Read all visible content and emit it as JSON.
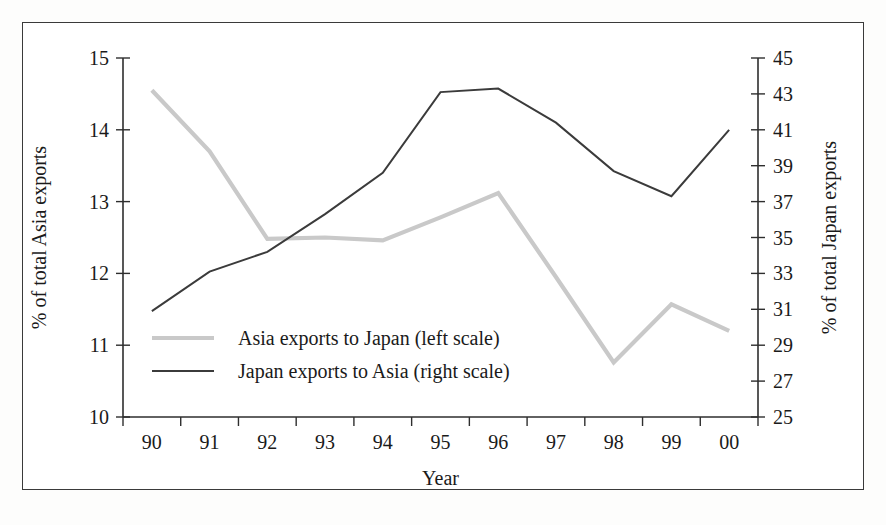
{
  "chart_data": {
    "type": "line",
    "title": "",
    "xlabel": "Year",
    "categories": [
      "90",
      "91",
      "92",
      "93",
      "94",
      "95",
      "96",
      "97",
      "98",
      "99",
      "00"
    ],
    "grid": false,
    "legend_position": "inside-left-lower",
    "axes": {
      "left": {
        "label": "% of total Asia exports",
        "min": 10,
        "max": 15,
        "tick_step": 1,
        "ticks": [
          "10",
          "11",
          "12",
          "13",
          "14",
          "15"
        ]
      },
      "right": {
        "label": "% of total Japan exports",
        "min": 25,
        "max": 45,
        "tick_step": 2,
        "ticks": [
          "25",
          "27",
          "29",
          "31",
          "33",
          "35",
          "37",
          "39",
          "41",
          "43",
          "45"
        ]
      },
      "x": {
        "label": "Year"
      }
    },
    "series": [
      {
        "name": "Asia exports to Japan (left scale)",
        "axis": "left",
        "color": "#c9c9c9",
        "style": "solid-thick-light",
        "values": [
          14.55,
          13.7,
          12.48,
          12.5,
          12.46,
          12.78,
          13.12,
          11.95,
          10.76,
          11.57,
          11.2
        ]
      },
      {
        "name": "Japan exports to Asia (right scale)",
        "axis": "right",
        "color": "#3b3b3b",
        "style": "solid-thin-dark",
        "values": [
          30.9,
          33.1,
          34.2,
          36.3,
          38.6,
          43.1,
          43.3,
          41.4,
          38.7,
          37.3,
          41.0
        ]
      }
    ],
    "legend": [
      {
        "label": "Asia exports to Japan (left scale)",
        "color": "#c9c9c9"
      },
      {
        "label": "Japan exports to Asia (right scale)",
        "color": "#3b3b3b"
      }
    ]
  }
}
